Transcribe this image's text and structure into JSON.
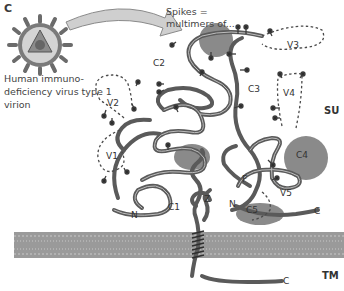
{
  "figure": {
    "panel_label": "C",
    "virion_caption": "Human immuno-deficiency virus type 1 virion",
    "callout_text": "Spikes = multimers of...",
    "regions": {
      "v1": "V1",
      "v2": "V2",
      "v3": "V3",
      "v4": "V4",
      "v5": "V5",
      "c1": "C1",
      "c2": "C2",
      "c3": "C3",
      "c4": "C4",
      "c5": "C5",
      "f": "F",
      "z": "Z",
      "n_su": "N",
      "n_tm": "N",
      "c_su": "C",
      "c_tm": "C"
    },
    "subunits": {
      "su": "SU",
      "tm": "TM"
    },
    "colors": {
      "backbone": "#5a5a5a",
      "backbone_inner": "#b8b8b8",
      "domain_blob": "#8a8a8a",
      "membrane": "#9a9a9a",
      "arrow_fill": "#c8c8c8",
      "text": "#3a3a3a"
    }
  }
}
